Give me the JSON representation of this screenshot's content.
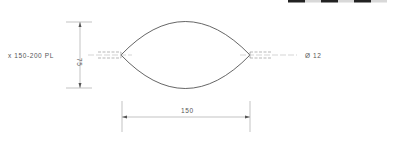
{
  "drawing": {
    "label_left": "x 150-200 PL",
    "height_dim": "75",
    "width_dim": "150",
    "diameter_label": "Ø 12"
  },
  "scale_bar": {
    "segments": [
      "black",
      "light",
      "black",
      "light",
      "black",
      "light"
    ],
    "colors": {
      "black": "#222222",
      "light": "#d8d8d8"
    }
  },
  "colors": {
    "outline": "#555555",
    "dimension": "#9a9a9a",
    "text": "#555555"
  }
}
